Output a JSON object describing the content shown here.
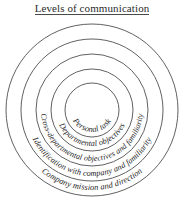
{
  "title": {
    "text": "Levels of communication",
    "underlined": true
  },
  "diagram": {
    "type": "concentric-circles",
    "center": {
      "x": 92,
      "y": 110
    },
    "background_color": "#ffffff",
    "stroke_color": "#4f4f4f",
    "text_color": "#232323",
    "rings": [
      {
        "id": "ring-1",
        "level": 1,
        "label": "Personal task",
        "radius": 27,
        "text_radius": 22,
        "font_size": 8.2
      },
      {
        "id": "ring-2",
        "level": 2,
        "label": "Departmental objectives",
        "radius": 41,
        "text_radius": 36,
        "font_size": 8.2
      },
      {
        "id": "ring-3",
        "level": 3,
        "label": "Cross-departmental objectives and familiarity",
        "radius": 56,
        "text_radius": 51,
        "font_size": 8.0
      },
      {
        "id": "ring-4",
        "level": 4,
        "label": "Identification with company and familiarity",
        "radius": 71,
        "text_radius": 66,
        "font_size": 8.2
      },
      {
        "id": "ring-5",
        "level": 5,
        "label": "Company mission and direction",
        "radius": 86,
        "text_radius": 80,
        "font_size": 8.4
      }
    ]
  }
}
